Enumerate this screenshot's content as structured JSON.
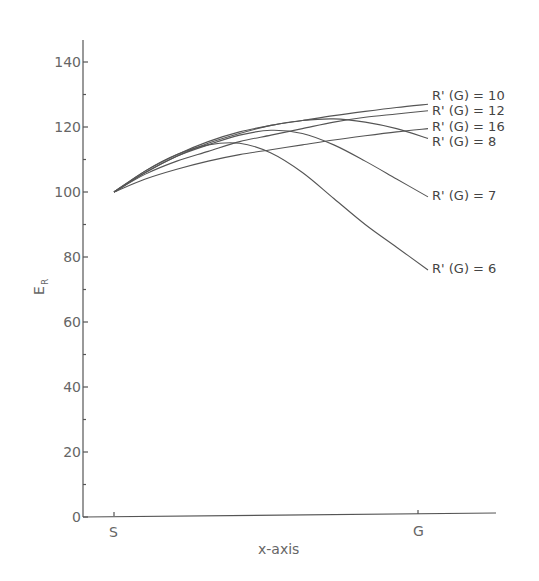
{
  "chart_data": {
    "type": "line",
    "title": "",
    "xlabel": "x-axis",
    "ylabel": "E_R",
    "ylabel_main": "E",
    "ylabel_sub": "R",
    "ylim": [
      0,
      150
    ],
    "yticks": [
      0,
      20,
      40,
      60,
      80,
      100,
      120,
      140
    ],
    "xtick_labels": [
      "S",
      "G"
    ],
    "grid": false,
    "legend_position": "inline labels at right end of curves",
    "x": [
      0,
      0.1,
      0.2,
      0.3,
      0.4,
      0.5,
      0.6,
      0.7,
      0.8,
      0.9,
      1.0
    ],
    "series": [
      {
        "name": "R' (G) = 10",
        "values": [
          100,
          106.5,
          111.5,
          115.5,
          118.5,
          120.5,
          122,
          123.5,
          124.8,
          126,
          127
        ]
      },
      {
        "name": "R' (G) = 12",
        "values": [
          100,
          105.5,
          109.5,
          112.5,
          115.5,
          117.5,
          119.5,
          121.5,
          123,
          124,
          125
        ]
      },
      {
        "name": "R' (G) = 16",
        "values": [
          100,
          104,
          107,
          109.5,
          111.5,
          113,
          114.5,
          116,
          117.3,
          118.5,
          119.5
        ]
      },
      {
        "name": "R' (G) = 8",
        "values": [
          100,
          106,
          111,
          115,
          118,
          120.5,
          122,
          122.5,
          121.5,
          119.5,
          116.5
        ]
      },
      {
        "name": "R' (G) = 7",
        "values": [
          100,
          106,
          111,
          114.5,
          117.5,
          119,
          118,
          114.5,
          109.5,
          104,
          98.5
        ]
      },
      {
        "name": "R' (G) = 6",
        "values": [
          100,
          106.5,
          111.5,
          114.5,
          115,
          112,
          106,
          98,
          90,
          83,
          76
        ]
      }
    ]
  },
  "axes": {
    "xlabel": "x-axis",
    "ylabel_main": "E",
    "ylabel_sub": "R",
    "yticks": [
      "0",
      "20",
      "40",
      "60",
      "80",
      "100",
      "120",
      "140"
    ],
    "xticks": [
      "S",
      "G"
    ]
  },
  "labels": [
    "R' (G) = 10",
    "R' (G) = 12",
    "R' (G) = 16",
    "R' (G) = 8",
    "R' (G) = 7",
    "R' (G) = 6"
  ]
}
